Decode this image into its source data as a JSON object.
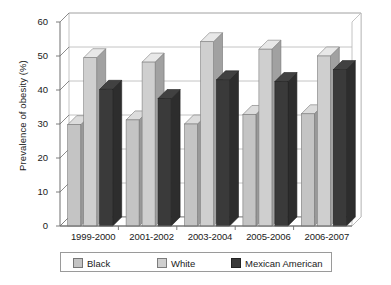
{
  "chart_data": {
    "type": "bar",
    "title": "",
    "xlabel": "",
    "ylabel": "Prevalence of obesity (%)",
    "ylim": [
      0,
      60
    ],
    "yticks": [
      0,
      10,
      20,
      30,
      40,
      50,
      60
    ],
    "grid": true,
    "legend_position": "bottom",
    "categories": [
      "1999-2000",
      "2001-2002",
      "2003-2004",
      "2005-2006",
      "2006-2007"
    ],
    "series": [
      {
        "name": "Black",
        "color": "#c4c4c4",
        "values": [
          29.8,
          31.2,
          30.0,
          32.8,
          33.0
        ]
      },
      {
        "name": "White",
        "color": "#cfcfcf",
        "values": [
          49.5,
          48.2,
          54.2,
          52.0,
          50.0
        ]
      },
      {
        "name": "Mexican American",
        "color": "#3a3a3a",
        "values": [
          40.2,
          37.5,
          43.0,
          42.5,
          46.0
        ]
      }
    ]
  },
  "yaxis": {
    "label": "Prevalence of obesity (%)",
    "ticks": [
      "0",
      "10",
      "20",
      "30",
      "40",
      "50",
      "60"
    ]
  },
  "xaxis": {
    "ticks": [
      "1999-2000",
      "2001-2002",
      "2003-2004",
      "2005-2006",
      "2006-2007"
    ]
  },
  "legend": {
    "items": [
      {
        "label": "Black",
        "color": "#c4c4c4"
      },
      {
        "label": "White",
        "color": "#cfcfcf"
      },
      {
        "label": "Mexican American",
        "color": "#3a3a3a"
      }
    ]
  },
  "colors": {
    "axis": "#6e6e6e",
    "grid": "#b5b5b5",
    "text": "#1a1a1a",
    "background": "#ffffff",
    "legend_border": "#9a9a9a"
  }
}
